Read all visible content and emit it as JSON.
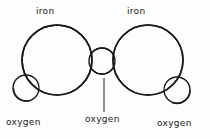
{
  "figure": {
    "background_color": "#fdfdfd",
    "stroke_color": "#1a1a1a"
  },
  "labels": {
    "iron_left": "iron",
    "iron_right": "iron",
    "oxygen_left": "oxygen",
    "oxygen_middle": "oxygen",
    "oxygen_right": "oxygen"
  },
  "atoms": [
    {
      "name": "iron-left",
      "element": "iron",
      "cx": 57,
      "cy": 60,
      "r": 35
    },
    {
      "name": "iron-right",
      "element": "iron",
      "cx": 148,
      "cy": 60,
      "r": 35
    },
    {
      "name": "oxygen-middle",
      "element": "oxygen",
      "cx": 102,
      "cy": 61,
      "r": 13
    },
    {
      "name": "oxygen-left",
      "element": "oxygen",
      "cx": 26,
      "cy": 88,
      "r": 13
    },
    {
      "name": "oxygen-right",
      "element": "oxygen",
      "cx": 177,
      "cy": 90,
      "r": 13
    }
  ],
  "leader_line": {
    "x": 104,
    "y1": 78,
    "y2": 112
  }
}
